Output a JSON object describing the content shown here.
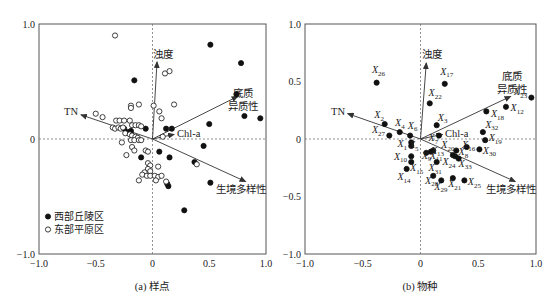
{
  "chart_data": [
    {
      "type": "scatter",
      "title": "(a) 样点",
      "caption": "(a) 样点",
      "xlabel": "",
      "ylabel": "",
      "xlim": [
        -1.0,
        1.0
      ],
      "ylim": [
        -1.0,
        1.0
      ],
      "xticks": [
        "-1.0",
        "-0.5",
        "0",
        "0.5",
        "1.0"
      ],
      "yticks": [
        "1.0",
        "0",
        "-1.0"
      ],
      "grid": false,
      "zero_lines": "dashed",
      "legend": {
        "position": "lower-left",
        "entries": [
          {
            "label": "西部丘陵区",
            "marker": "filled-circle"
          },
          {
            "label": "东部平原区",
            "marker": "open-circle"
          }
        ]
      },
      "vectors": [
        {
          "name": "浊度",
          "x": 0.04,
          "y": 0.67,
          "label_lines": [
            "浊度"
          ]
        },
        {
          "name": "底质异质性",
          "x": 0.75,
          "y": 0.37,
          "label_lines": [
            "底质",
            "异质性"
          ]
        },
        {
          "name": "TN",
          "x": -0.63,
          "y": 0.21,
          "label_lines": [
            "TN"
          ]
        },
        {
          "name": "Chl-a",
          "x": 0.19,
          "y": 0.04,
          "label_lines": [
            "Chl-a"
          ]
        },
        {
          "name": "生境多样性",
          "x": 0.82,
          "y": -0.37,
          "label_lines": [
            "生境多样性"
          ]
        }
      ],
      "series": [
        {
          "name": "西部丘陵区",
          "marker": "filled",
          "points": [
            [
              0.51,
              0.82
            ],
            [
              0.78,
              0.66
            ],
            [
              -0.16,
              0.51
            ],
            [
              0.74,
              0.39
            ],
            [
              0.81,
              0.2
            ],
            [
              0.95,
              0.18
            ],
            [
              0.5,
              0.13
            ],
            [
              -0.06,
              0.09
            ],
            [
              0.12,
              0.09
            ],
            [
              0.17,
              0.09
            ],
            [
              -0.25,
              0.09
            ],
            [
              -0.22,
              0.06
            ],
            [
              -0.19,
              0.07
            ],
            [
              0.45,
              -0.06
            ],
            [
              -0.1,
              -0.16
            ],
            [
              0.06,
              -0.11
            ],
            [
              0.15,
              -0.16
            ],
            [
              0.37,
              -0.2
            ],
            [
              0.51,
              -0.38
            ],
            [
              0.13,
              -0.39
            ],
            [
              0.14,
              -0.41
            ],
            [
              0.28,
              -0.62
            ]
          ]
        },
        {
          "name": "东部平原区",
          "marker": "open",
          "points": [
            [
              -0.33,
              0.9
            ],
            [
              0.11,
              0.57
            ],
            [
              0.15,
              0.59
            ],
            [
              -0.19,
              0.29
            ],
            [
              -0.12,
              0.3
            ],
            [
              -0.19,
              0.27
            ],
            [
              0.01,
              0.29
            ],
            [
              0.19,
              0.3
            ],
            [
              0.06,
              0.24
            ],
            [
              0.08,
              0.18
            ],
            [
              -0.5,
              0.22
            ],
            [
              -0.44,
              0.19
            ],
            [
              -0.32,
              0.16
            ],
            [
              -0.29,
              0.16
            ],
            [
              -0.25,
              0.16
            ],
            [
              -0.2,
              0.16
            ],
            [
              -0.18,
              0.12
            ],
            [
              -0.15,
              0.12
            ],
            [
              -0.12,
              0.12
            ],
            [
              -0.1,
              0.11
            ],
            [
              -0.35,
              0.1
            ],
            [
              -0.33,
              0.09
            ],
            [
              -0.3,
              0.1
            ],
            [
              -0.28,
              0.09
            ],
            [
              -0.26,
              0.1
            ],
            [
              -0.24,
              0.05
            ],
            [
              -0.2,
              0.04
            ],
            [
              -0.18,
              0.03
            ],
            [
              -0.15,
              0.02
            ],
            [
              -0.13,
              0.01
            ],
            [
              -0.19,
              -0.01
            ],
            [
              -0.16,
              -0.01
            ],
            [
              -0.12,
              -0.01
            ],
            [
              -0.1,
              -0.01
            ],
            [
              0.09,
              0.02
            ],
            [
              -0.27,
              -0.03
            ],
            [
              -0.18,
              -0.07
            ],
            [
              -0.16,
              -0.1
            ],
            [
              -0.06,
              -0.1
            ],
            [
              -0.04,
              -0.11
            ],
            [
              -0.23,
              -0.14
            ],
            [
              -0.04,
              -0.21
            ],
            [
              -0.02,
              -0.23
            ],
            [
              0.05,
              -0.24
            ],
            [
              -0.04,
              -0.26
            ],
            [
              -0.02,
              -0.28
            ],
            [
              -0.07,
              -0.29
            ],
            [
              -0.09,
              -0.31
            ],
            [
              -0.05,
              -0.32
            ],
            [
              -0.02,
              -0.32
            ],
            [
              0.02,
              -0.32
            ],
            [
              0.05,
              -0.33
            ],
            [
              0.08,
              -0.32
            ],
            [
              0.03,
              -0.36
            ],
            [
              0.12,
              -0.37
            ],
            [
              -0.12,
              -0.36
            ],
            [
              0.39,
              -0.22
            ]
          ]
        }
      ]
    },
    {
      "type": "scatter",
      "title": "(b) 物种",
      "caption": "(b) 物种",
      "xlabel": "",
      "ylabel": "",
      "xlim": [
        -1.0,
        1.0
      ],
      "ylim": [
        -1.0,
        1.0
      ],
      "xticks": [
        "-1.0",
        "-0.5",
        "0",
        "0.5",
        "1.0"
      ],
      "yticks": [
        "1.0",
        "0.5",
        "0",
        "-0.5",
        "-1.0"
      ],
      "grid": false,
      "zero_lines": "dashed",
      "vectors": [
        {
          "name": "浊度",
          "x": 0.05,
          "y": 0.66,
          "label_lines": [
            "浊度"
          ]
        },
        {
          "name": "底质异质性",
          "x": 0.78,
          "y": 0.37,
          "label_lines": [
            "底质",
            "异质性"
          ]
        },
        {
          "name": "TN",
          "x": -0.63,
          "y": 0.22,
          "label_lines": [
            "TN"
          ]
        },
        {
          "name": "Chl-a",
          "x": 0.19,
          "y": 0.04,
          "label_lines": [
            "Chl-a"
          ]
        },
        {
          "name": "生境多样性",
          "x": 0.82,
          "y": -0.37,
          "label_lines": [
            "生境多样性"
          ]
        }
      ],
      "series": [
        {
          "name": "物种",
          "marker": "filled",
          "points": [
            {
              "label": "X",
              "sub": "26",
              "x": -0.38,
              "y": 0.49,
              "lx": -0.42,
              "ly": 0.57
            },
            {
              "label": "X",
              "sub": "17",
              "x": 0.21,
              "y": 0.48,
              "lx": 0.17,
              "ly": 0.56
            },
            {
              "label": "X",
              "sub": "22",
              "x": 0.08,
              "y": 0.31,
              "lx": 0.07,
              "ly": 0.37
            },
            {
              "label": "X",
              "sub": "23",
              "x": 0.96,
              "y": 0.36,
              "lx": 0.81,
              "ly": 0.38
            },
            {
              "label": "X",
              "sub": "12",
              "x": 0.74,
              "y": 0.28,
              "lx": 0.78,
              "ly": 0.24
            },
            {
              "label": "X",
              "sub": "18",
              "x": 0.57,
              "y": 0.24,
              "lx": 0.61,
              "ly": 0.19
            },
            {
              "label": "X",
              "sub": "2",
              "x": -0.31,
              "y": 0.13,
              "lx": -0.4,
              "ly": 0.18
            },
            {
              "label": "X",
              "sub": "4",
              "x": -0.18,
              "y": 0.06,
              "lx": -0.22,
              "ly": 0.11
            },
            {
              "label": "X",
              "sub": "6",
              "x": -0.09,
              "y": 0.03,
              "lx": -0.11,
              "ly": 0.09
            },
            {
              "label": "X",
              "sub": "27",
              "x": -0.27,
              "y": 0.03,
              "lx": -0.42,
              "ly": 0.05
            },
            {
              "label": "X",
              "sub": "3",
              "x": 0.14,
              "y": 0.12,
              "lx": 0.15,
              "ly": 0.16
            },
            {
              "label": "X",
              "sub": "32",
              "x": 0.54,
              "y": 0.06,
              "lx": 0.56,
              "ly": 0.1
            },
            {
              "label": "X",
              "sub": "19",
              "x": 0.56,
              "y": -0.01,
              "lx": 0.59,
              "ly": -0.02
            },
            {
              "label": "X",
              "sub": "7",
              "x": 0.16,
              "y": 0.03,
              "lx": 0.07,
              "ly": -0.02
            },
            {
              "label": "X",
              "sub": "1",
              "x": -0.08,
              "y": -0.03,
              "lx": -0.2,
              "ly": -0.07
            },
            {
              "label": "X",
              "sub": "5",
              "x": -0.08,
              "y": -0.06,
              "lx": -0.1,
              "ly": -0.08
            },
            {
              "label": "X",
              "sub": "20",
              "x": 0.31,
              "y": -0.1,
              "lx": 0.18,
              "ly": -0.08
            },
            {
              "label": "X",
              "sub": "16",
              "x": 0.4,
              "y": -0.07,
              "lx": 0.36,
              "ly": -0.08
            },
            {
              "label": "X",
              "sub": "30",
              "x": 0.51,
              "y": -0.09,
              "lx": 0.54,
              "ly": -0.13
            },
            {
              "label": "X",
              "sub": "8",
              "x": 0.3,
              "y": -0.15,
              "lx": 0.33,
              "ly": -0.14
            },
            {
              "label": "X",
              "sub": "10",
              "x": -0.08,
              "y": -0.15,
              "lx": -0.23,
              "ly": -0.18
            },
            {
              "label": "X",
              "sub": "9",
              "x": 0.05,
              "y": -0.12,
              "lx": 0.01,
              "ly": -0.17
            },
            {
              "label": "X",
              "sub": "11",
              "x": 0.09,
              "y": -0.11,
              "lx": 0.08,
              "ly": -0.17
            },
            {
              "label": "X",
              "sub": "13",
              "x": 0.11,
              "y": -0.1,
              "lx": 0.09,
              "ly": -0.13
            },
            {
              "label": "X",
              "sub": "15",
              "x": -0.08,
              "y": -0.2,
              "lx": -0.09,
              "ly": -0.28
            },
            {
              "label": "X",
              "sub": "31",
              "x": 0.14,
              "y": -0.2,
              "lx": 0.07,
              "ly": -0.28
            },
            {
              "label": "X",
              "sub": "24",
              "x": 0.28,
              "y": -0.14,
              "lx": 0.19,
              "ly": -0.23
            },
            {
              "label": "X",
              "sub": "33",
              "x": 0.33,
              "y": -0.17,
              "lx": 0.33,
              "ly": -0.24
            },
            {
              "label": "X",
              "sub": "14",
              "x": -0.12,
              "y": -0.26,
              "lx": -0.2,
              "ly": -0.36
            },
            {
              "label": "X",
              "sub": "28",
              "x": 0.11,
              "y": -0.32,
              "lx": 0.04,
              "ly": -0.39
            },
            {
              "label": "X",
              "sub": "29",
              "x": 0.18,
              "y": -0.36,
              "lx": 0.12,
              "ly": -0.44
            },
            {
              "label": "X",
              "sub": "21",
              "x": 0.28,
              "y": -0.34,
              "lx": 0.24,
              "ly": -0.42
            },
            {
              "label": "X",
              "sub": "25",
              "x": 0.38,
              "y": -0.36,
              "lx": 0.41,
              "ly": -0.4
            }
          ]
        }
      ]
    }
  ],
  "captions": {
    "a": "(a) 样点",
    "b": "(b) 物种"
  },
  "legend": {
    "west": "西部丘陵区",
    "east": "东部平原区"
  },
  "colors": {
    "axis": "#555555",
    "points": "#111111",
    "arrows": "#333333",
    "dashed": "#777777"
  }
}
